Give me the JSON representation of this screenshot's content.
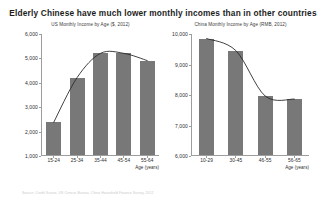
{
  "title": "Elderly Chinese have much lower monthly incomes than in other countries",
  "footnote": "Source: Credit Suisse, US Census Bureau, China Household Finance Survey, 2012",
  "colors": {
    "bar": "#787878",
    "line": "#2b2b2b",
    "axis": "#9d9d9d",
    "background": "#ffffff",
    "title_text": "#1c1c1c"
  },
  "chart_data": [
    {
      "type": "bar",
      "id": "us-income-by-age",
      "title": "US Monthly Income by Age ($, 2012)",
      "xlabel": "Age (years)",
      "ylabel": "",
      "categories": [
        "15-24",
        "25-34",
        "35-44",
        "45-54",
        "55-64"
      ],
      "values": [
        2350,
        4200,
        5200,
        5200,
        4900
      ],
      "yticks": [
        "1,000",
        "2,000",
        "3,000",
        "4,000",
        "5,000",
        "6,000"
      ],
      "ytick_values": [
        1000,
        2000,
        3000,
        4000,
        5000,
        6000
      ],
      "ylim": [
        1000,
        6000
      ],
      "grid": false,
      "legend": "none",
      "overlay": {
        "type": "line",
        "values": [
          2350,
          4200,
          5200,
          5200,
          4900
        ]
      }
    },
    {
      "type": "bar",
      "id": "china-income-by-age",
      "title": "China Monthly Income by Age (RMB, 2012)",
      "xlabel": "Age (years)",
      "ylabel": "",
      "categories": [
        "10-29",
        "30-45",
        "46-55",
        "56-65"
      ],
      "values": [
        9850,
        9450,
        7950,
        7850
      ],
      "yticks": [
        "6,000",
        "7,000",
        "8,000",
        "9,000",
        "10,000"
      ],
      "ytick_values": [
        6000,
        7000,
        8000,
        9000,
        10000
      ],
      "ylim": [
        6000,
        10000
      ],
      "grid": false,
      "legend": "none",
      "overlay": {
        "type": "line",
        "values": [
          9850,
          9450,
          7950,
          7850
        ]
      }
    }
  ]
}
